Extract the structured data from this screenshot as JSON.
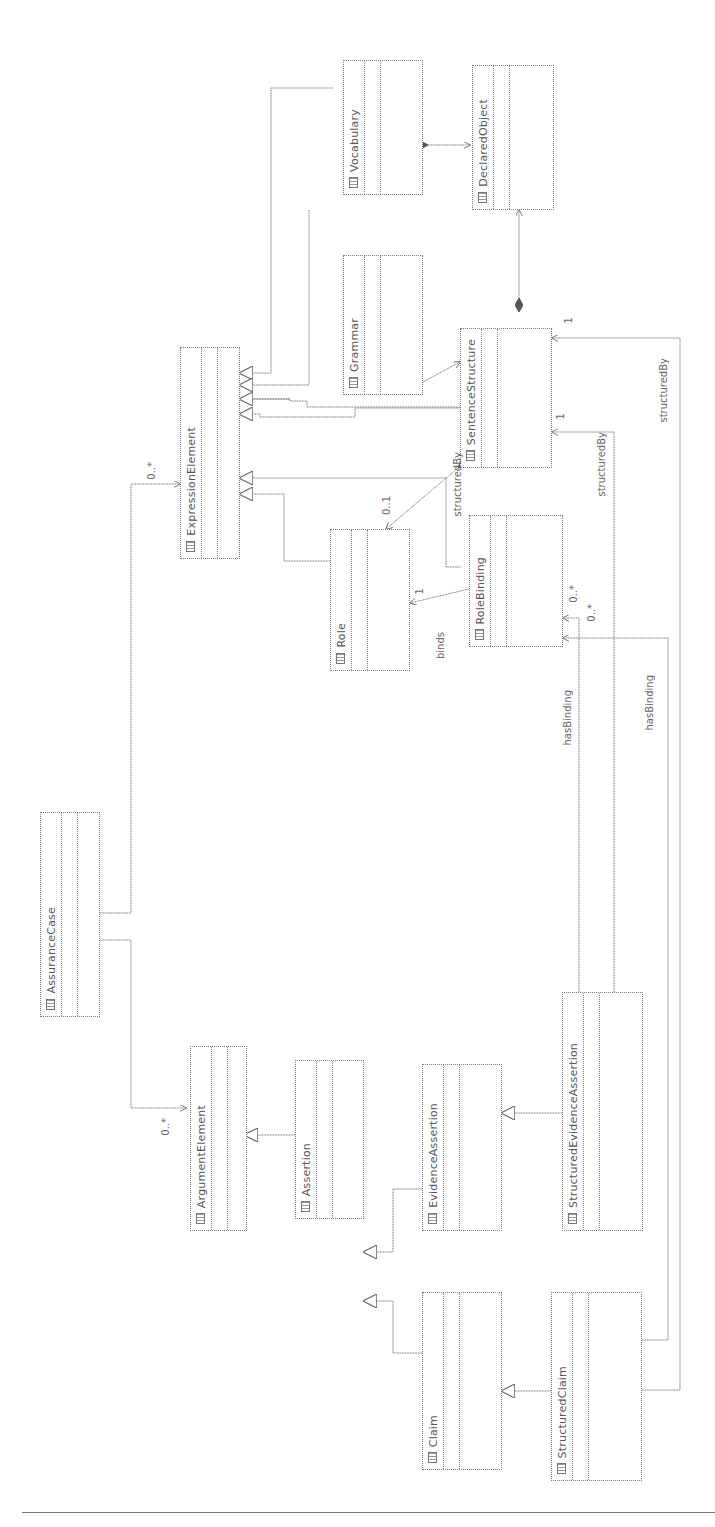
{
  "diagram": {
    "type": "UML class diagram (rotated 90°)",
    "classes": [
      {
        "id": "vocabulary",
        "name": "Vocabulary"
      },
      {
        "id": "declared-object",
        "name": "DeclaredObject"
      },
      {
        "id": "grammar",
        "name": "Grammar"
      },
      {
        "id": "sentence-structure",
        "name": "SentenceStructure"
      },
      {
        "id": "expression-element",
        "name": "ExpressionElement"
      },
      {
        "id": "role",
        "name": "Role"
      },
      {
        "id": "role-binding",
        "name": "RoleBinding"
      },
      {
        "id": "assurance-case",
        "name": "AssuranceCase"
      },
      {
        "id": "argument-element",
        "name": "ArgumentElement"
      },
      {
        "id": "assertion",
        "name": "Assertion"
      },
      {
        "id": "evidence-assertion",
        "name": "EvidenceAssertion"
      },
      {
        "id": "structured-evidence-assertion",
        "name": "StructuredEvidenceAssertion"
      },
      {
        "id": "claim",
        "name": "Claim"
      },
      {
        "id": "structured-claim",
        "name": "StructuredClaim"
      }
    ],
    "labels": {
      "structured_by_1": "structuredBy",
      "structured_by_2": "structuredBy",
      "structured_by_3": "structuredBy",
      "binds": "binds",
      "has_binding_1": "hasBinding",
      "has_binding_2": "hasBinding",
      "mult_role": "0..1",
      "mult_role_binds": "1",
      "mult_rolebinding_1": "0..*",
      "mult_rolebinding_2": "0..*",
      "mult_ss_1": "1",
      "mult_ss_2": "1",
      "mult_expr": "0..*",
      "mult_arg": "0..*"
    }
  }
}
